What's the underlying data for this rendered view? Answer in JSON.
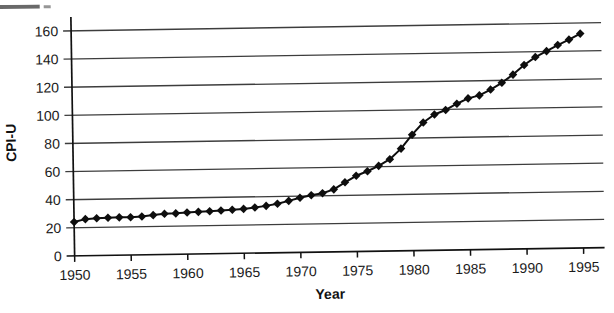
{
  "figure": {
    "x_axis_title": "Year",
    "y_axis_title": "CPI-U"
  },
  "colors": {
    "line": "#0e0e0e",
    "marker": "#0e0e0e",
    "gridline": "#3d3d3d",
    "axis": "#111111",
    "text": "#1b1b1b",
    "background": "#ffffff"
  },
  "chart_data": {
    "type": "line",
    "title": "",
    "xlabel": "Year",
    "ylabel": "CPI-U",
    "series_name": "CPI-U",
    "marker": "diamond",
    "grid": "horizontal",
    "legend": "none",
    "xlim": [
      1950,
      1995
    ],
    "ylim": [
      0,
      160
    ],
    "x_ticks": [
      1950,
      1955,
      1960,
      1965,
      1970,
      1975,
      1980,
      1985,
      1990,
      1995
    ],
    "y_ticks": [
      0,
      20,
      40,
      60,
      80,
      100,
      120,
      140,
      160
    ],
    "x": [
      1950,
      1951,
      1952,
      1953,
      1954,
      1955,
      1956,
      1957,
      1958,
      1959,
      1960,
      1961,
      1962,
      1963,
      1964,
      1965,
      1966,
      1967,
      1968,
      1969,
      1970,
      1971,
      1972,
      1973,
      1974,
      1975,
      1976,
      1977,
      1978,
      1979,
      1980,
      1981,
      1982,
      1983,
      1984,
      1985,
      1986,
      1987,
      1988,
      1989,
      1990,
      1991,
      1992,
      1993,
      1994,
      1995
    ],
    "values": [
      24.1,
      26.0,
      26.5,
      26.7,
      26.9,
      26.8,
      27.2,
      28.1,
      28.9,
      29.1,
      29.6,
      29.9,
      30.2,
      30.6,
      31.0,
      31.5,
      32.4,
      33.4,
      34.8,
      36.7,
      38.8,
      40.5,
      41.8,
      44.4,
      49.3,
      53.8,
      56.9,
      60.6,
      65.2,
      72.6,
      82.4,
      90.9,
      96.5,
      99.6,
      103.9,
      107.6,
      109.6,
      113.6,
      118.3,
      124.0,
      130.7,
      136.2,
      140.3,
      144.5,
      148.2,
      152.4
    ]
  }
}
